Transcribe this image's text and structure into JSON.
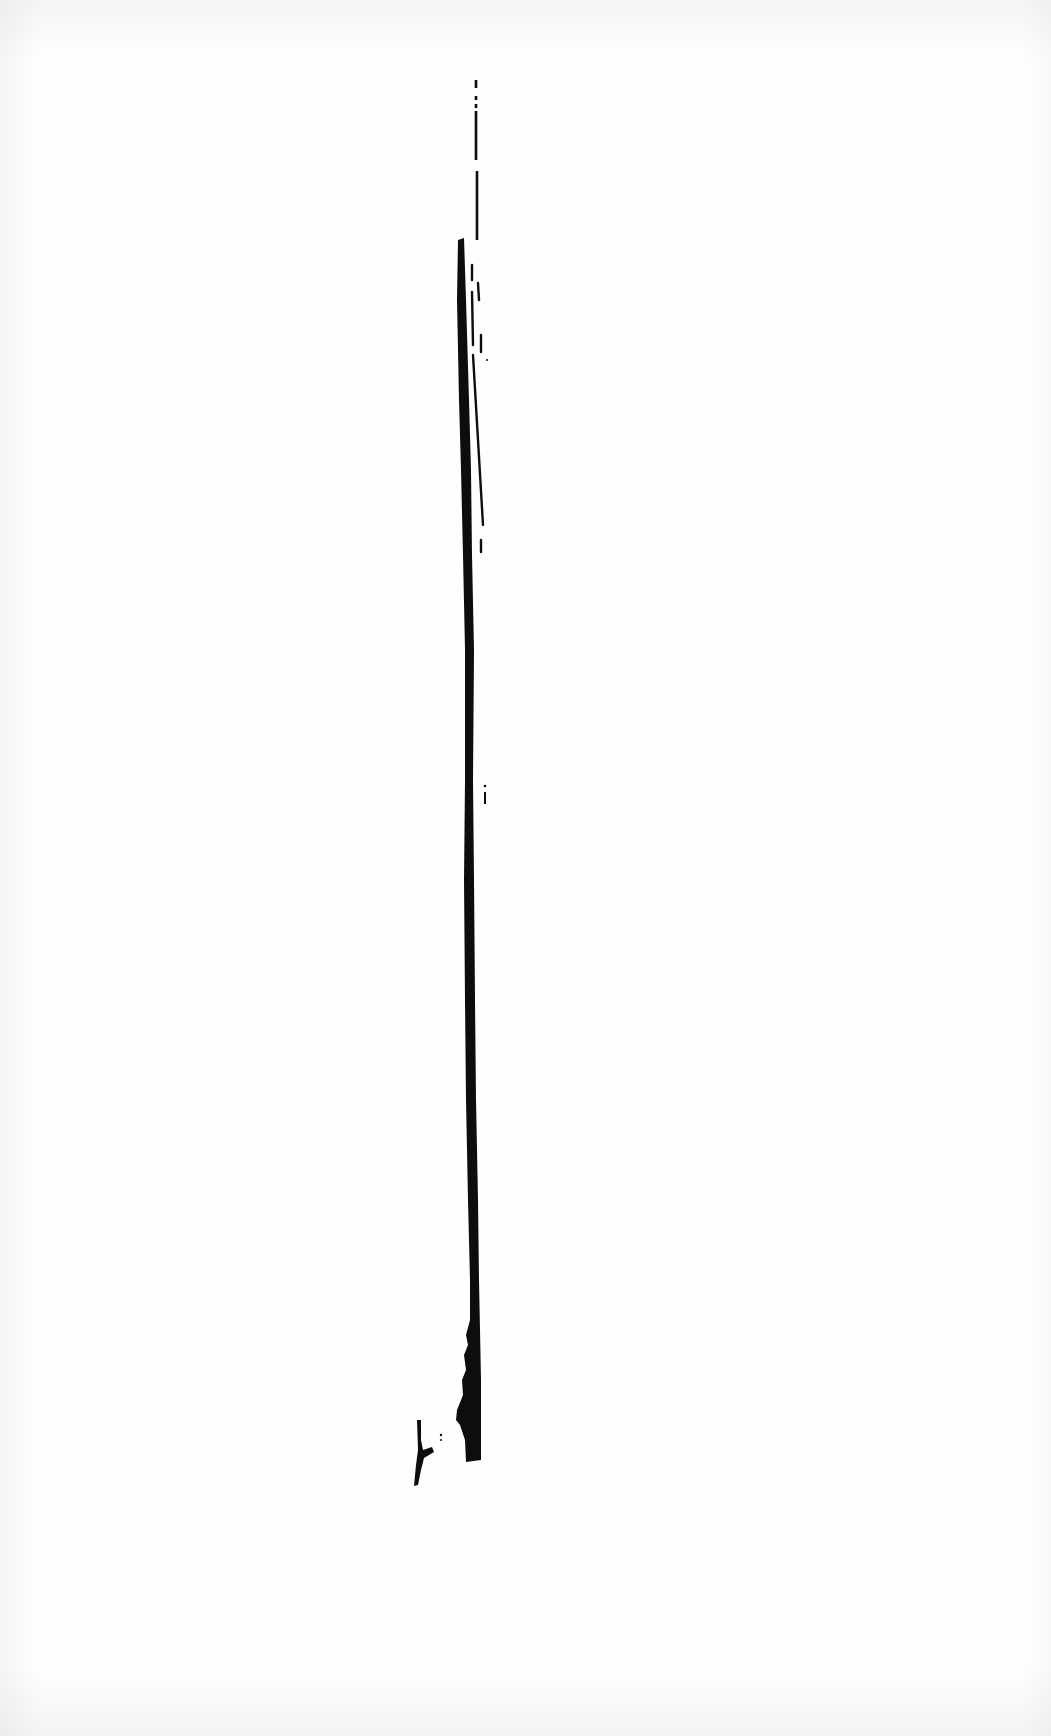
{
  "artwork": {
    "kind": "scanned ink drawing",
    "paper_color": "#fefefe",
    "ink_color": "#0d0d0d",
    "strokes": {
      "main": "M458,240 L464,238 L466,300 L469,400 L471,470 L472,555 L474,650 L473,780 L474,880 L475,1000 L476,1100 L478,1200 L479,1280 L480,1330 L481,1380 L481,1460 L466,1462 L465,1440 L460,1425 L456,1420 L457,1410 L463,1395 L462,1380 L466,1370 L464,1355 L468,1345 L466,1335 L470,1320 L470,1280 L468,1200 L466,1100 L465,1000 L464,880 L465,780 L465,650 L463,555 L461,470 L459,400 L457,300 Z",
      "hook": "M417,1420 L421,1420 L421,1440 L423,1450 L432,1447 L434,1452 L424,1458 L421,1470 L418,1485 L414,1486 L416,1465 L418,1450 Z",
      "top_dashes": [
        {
          "x": 476,
          "y1": 80,
          "y2": 88
        },
        {
          "x": 476,
          "y1": 96,
          "y2": 100
        },
        {
          "x": 476,
          "y1": 104,
          "y2": 108
        },
        {
          "x": 476,
          "y1": 111,
          "y2": 160
        },
        {
          "x": 477,
          "y1": 171,
          "y2": 240
        }
      ],
      "side_dashes": [
        {
          "x1": 472,
          "y1": 265,
          "x2": 472,
          "y2": 280
        },
        {
          "x1": 478,
          "y1": 283,
          "x2": 479,
          "y2": 300
        },
        {
          "x1": 472,
          "y1": 292,
          "x2": 473,
          "y2": 345
        },
        {
          "x1": 481,
          "y1": 335,
          "x2": 481,
          "y2": 352
        },
        {
          "x1": 473,
          "y1": 355,
          "x2": 483,
          "y2": 525
        },
        {
          "x1": 481,
          "y1": 540,
          "x2": 481,
          "y2": 552
        }
      ],
      "specks": [
        {
          "x": 487,
          "y": 360,
          "r": 1
        },
        {
          "x": 485,
          "y": 786,
          "r": 1.3
        },
        {
          "x": 441,
          "y": 1435,
          "r": 1.2
        },
        {
          "x": 441,
          "y": 1440,
          "r": 1
        }
      ],
      "small_mark": {
        "x1": 485,
        "y1": 792,
        "x2": 485,
        "y2": 804
      }
    }
  }
}
